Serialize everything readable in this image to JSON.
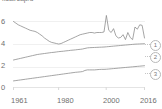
{
  "chart_data": {
    "type": "line",
    "title": "kcal/cap/d",
    "xlabel": "",
    "ylabel": "",
    "xlim": [
      1961,
      2016
    ],
    "ylim": [
      0,
      6.6
    ],
    "yticks": [
      0,
      2,
      4,
      6
    ],
    "ytick_labels": [
      "0",
      "2",
      "4",
      "6"
    ],
    "xticks": [
      1961,
      1980,
      2000,
      2016
    ],
    "xtick_labels": [
      "1961",
      "1980",
      "2000",
      "2016"
    ],
    "grid": true,
    "legend_position": "right",
    "legend_style": "numbered-badge",
    "x": [
      1961,
      1962,
      1963,
      1964,
      1965,
      1966,
      1967,
      1968,
      1969,
      1970,
      1971,
      1972,
      1973,
      1974,
      1975,
      1976,
      1977,
      1978,
      1979,
      1980,
      1981,
      1982,
      1983,
      1984,
      1985,
      1986,
      1987,
      1988,
      1989,
      1990,
      1991,
      1992,
      1993,
      1994,
      1995,
      1996,
      1997,
      1998,
      1999,
      2000,
      2001,
      2002,
      2003,
      2004,
      2005,
      2006,
      2007,
      2008,
      2009,
      2010,
      2011,
      2012,
      2013,
      2014,
      2015,
      2016
    ],
    "series": [
      {
        "name": "1",
        "label": "1",
        "color": "#8e8e8e",
        "values": [
          6.0,
          5.85,
          5.7,
          5.6,
          5.5,
          5.4,
          5.3,
          5.2,
          5.15,
          5.1,
          5.0,
          4.85,
          4.7,
          4.5,
          4.35,
          4.2,
          4.1,
          4.05,
          4.0,
          3.95,
          4.0,
          4.1,
          4.2,
          4.3,
          4.4,
          4.5,
          4.6,
          4.7,
          4.8,
          4.85,
          4.9,
          4.95,
          5.0,
          5.0,
          4.95,
          5.0,
          5.0,
          5.0,
          5.05,
          6.55,
          5.2,
          5.0,
          5.35,
          4.7,
          4.5,
          4.55,
          4.8,
          4.35,
          5.0,
          4.55,
          4.35,
          5.5,
          5.3,
          5.7,
          5.65,
          4.5
        ]
      },
      {
        "name": "2",
        "label": "2",
        "color": "#8e8e8e",
        "values": [
          2.5,
          2.55,
          2.6,
          2.65,
          2.7,
          2.75,
          2.8,
          2.85,
          2.9,
          2.95,
          3.0,
          3.03,
          3.06,
          3.09,
          3.12,
          3.15,
          3.18,
          3.2,
          3.23,
          3.26,
          3.28,
          3.3,
          3.33,
          3.35,
          3.38,
          3.4,
          3.42,
          3.45,
          3.47,
          3.5,
          3.55,
          3.6,
          3.62,
          3.63,
          3.64,
          3.65,
          3.66,
          3.67,
          3.68,
          3.7,
          3.72,
          3.74,
          3.76,
          3.78,
          3.8,
          3.82,
          3.84,
          3.86,
          3.88,
          3.9,
          3.92,
          3.94,
          3.95,
          3.96,
          3.97,
          3.98
        ]
      },
      {
        "name": "3",
        "label": "3",
        "color": "#8e8e8e",
        "values": [
          0.6,
          0.63,
          0.66,
          0.69,
          0.72,
          0.75,
          0.78,
          0.81,
          0.84,
          0.87,
          0.9,
          0.93,
          0.96,
          0.99,
          1.02,
          1.05,
          1.08,
          1.11,
          1.14,
          1.17,
          1.2,
          1.23,
          1.26,
          1.29,
          1.32,
          1.35,
          1.38,
          1.4,
          1.42,
          1.45,
          1.55,
          1.6,
          1.6,
          1.6,
          1.6,
          1.62,
          1.64,
          1.65,
          1.65,
          1.66,
          1.68,
          1.7,
          1.72,
          1.74,
          1.76,
          1.78,
          1.8,
          1.82,
          1.84,
          1.86,
          1.88,
          1.9,
          1.92,
          1.94,
          1.96,
          1.98
        ]
      }
    ]
  },
  "legend": {
    "items": [
      {
        "label": "1"
      },
      {
        "label": "2"
      },
      {
        "label": "3"
      }
    ]
  }
}
